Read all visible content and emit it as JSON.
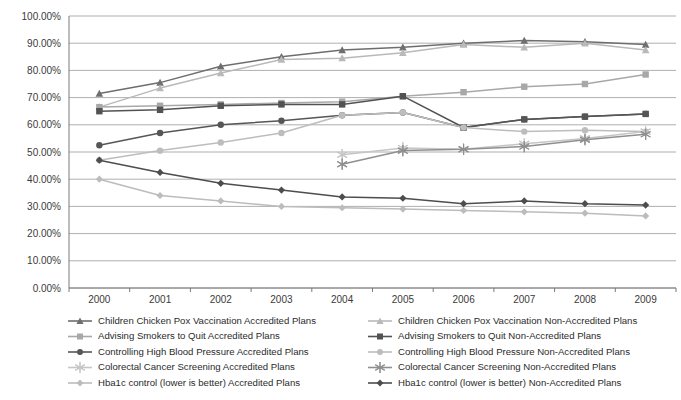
{
  "chart_data": {
    "type": "line",
    "title": "",
    "xlabel": "",
    "ylabel": "",
    "categories": [
      "2000",
      "2001",
      "2002",
      "2003",
      "2004",
      "2005",
      "2006",
      "2007",
      "2008",
      "2009"
    ],
    "ylim": [
      0,
      100
    ],
    "ytick_labels": [
      "0.00%",
      "10.00%",
      "20.00%",
      "30.00%",
      "40.00%",
      "50.00%",
      "60.00%",
      "70.00%",
      "80.00%",
      "90.00%",
      "100.00%"
    ],
    "ytick_values": [
      0,
      10,
      20,
      30,
      40,
      50,
      60,
      70,
      80,
      90,
      100
    ],
    "grid": true,
    "legend_position": "bottom",
    "series": [
      {
        "name": "Children Chicken Pox Vaccination Accredited Plans",
        "marker": "triangle",
        "color": "#6e6e6e",
        "values": [
          71.5,
          75.5,
          81.5,
          85.0,
          87.5,
          88.5,
          90.0,
          91.0,
          90.5,
          89.5
        ]
      },
      {
        "name": "Children Chicken Pox Vaccination Non-Accredited Plans",
        "marker": "triangle",
        "color": "#b9b9b9",
        "values": [
          66.5,
          73.5,
          79.0,
          84.0,
          84.5,
          86.5,
          89.5,
          88.5,
          90.0,
          87.5
        ]
      },
      {
        "name": "Advising Smokers to Quit Accredited Plans",
        "marker": "square",
        "color": "#a8a8a8",
        "values": [
          66.5,
          67.0,
          67.5,
          68.0,
          68.5,
          70.5,
          72.0,
          74.0,
          75.0,
          78.5
        ]
      },
      {
        "name": "Advising Smokers to Quit Non-Accredited Plans",
        "marker": "square",
        "color": "#525252",
        "values": [
          65.0,
          65.5,
          67.0,
          67.5,
          67.5,
          70.5,
          59.0,
          62.0,
          63.0,
          64.0
        ]
      },
      {
        "name": "Controlling High Blood Pressure Accredited Plans",
        "marker": "circle",
        "color": "#565656",
        "values": [
          52.5,
          57.0,
          60.0,
          61.5,
          63.5,
          64.5,
          59.0,
          62.0,
          63.0,
          64.0
        ]
      },
      {
        "name": "Controlling High Blood Pressure Non-Accredited Plans",
        "marker": "circle",
        "color": "#bdbdbd",
        "values": [
          47.0,
          50.5,
          53.5,
          57.0,
          63.5,
          64.5,
          59.0,
          57.5,
          58.0,
          57.5
        ]
      },
      {
        "name": "Colorectal Cancer Screening Accredited Plans",
        "marker": "asterisk",
        "color": "#c6c6c6",
        "values": [
          null,
          null,
          null,
          null,
          49.0,
          51.5,
          51.0,
          53.0,
          55.0,
          57.5
        ]
      },
      {
        "name": "Colorectal Cancer Screening Non-Accredited Plans",
        "marker": "asterisk",
        "color": "#8f8f8f",
        "values": [
          null,
          null,
          null,
          null,
          45.5,
          50.5,
          51.0,
          52.0,
          54.5,
          56.5
        ]
      },
      {
        "name": "Hba1c control (lower is better) Accredited Plans",
        "marker": "diamond",
        "color": "#bcbcbc",
        "values": [
          40.0,
          34.0,
          32.0,
          30.0,
          29.5,
          29.0,
          28.5,
          28.0,
          27.5,
          26.5
        ]
      },
      {
        "name": "Hba1c control (lower is better) Non-Accredited Plans",
        "marker": "diamond",
        "color": "#4d4d4d",
        "values": [
          47.0,
          42.5,
          38.5,
          36.0,
          33.5,
          33.0,
          31.0,
          32.0,
          31.0,
          30.5
        ]
      }
    ]
  },
  "legend": {
    "left_column": [
      "Children Chicken Pox Vaccination Accredited Plans",
      "Advising Smokers to Quit Accredited Plans",
      "Controlling High Blood Pressure Accredited Plans",
      "Colorectal Cancer Screening Accredited Plans",
      "Hba1c control (lower is better) Accredited Plans"
    ],
    "right_column": [
      "Children Chicken Pox Vaccination Non-Accredited Plans",
      "Advising Smokers to Quit Non-Accredited Plans",
      "Controlling High Blood Pressure Non-Accredited Plans",
      "Colorectal Cancer Screening Non-Accredited Plans",
      "Hba1c control (lower is better) Non-Accredited Plans"
    ]
  }
}
